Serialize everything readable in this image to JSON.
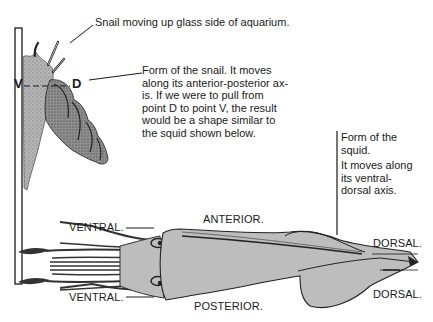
{
  "snail": {
    "caption": "Snail moving up glass side of aquarium.",
    "point_v": "V",
    "point_d": "D",
    "description_lines": [
      "Form of the snail. It moves",
      "along its anterior-posterior ax-",
      "is. If we were to pull from",
      "point D to point V, the result",
      "would be a shape similar to",
      "the squid shown below."
    ]
  },
  "squid": {
    "title_lines": [
      "Form of the",
      "squid."
    ],
    "description_lines": [
      "It moves along",
      "its ventral-",
      "dorsal axis."
    ],
    "labels": {
      "ventral_top": "VENTRAL.",
      "ventral_bottom": "VENTRAL.",
      "anterior": "ANTERIOR.",
      "posterior": "POSTERIOR.",
      "dorsal_top": "DORSAL.",
      "dorsal_bottom": "DORSAL."
    }
  },
  "colors": {
    "ink": "#1a1a1a",
    "body_fill": "#bdbdbd",
    "shell_fill": "#a9a9a9"
  }
}
